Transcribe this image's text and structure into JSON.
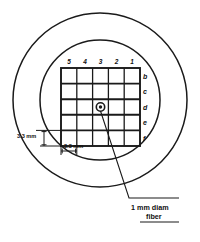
{
  "figure": {
    "background_color": "#ffffff",
    "ink_color": "#1a1a1a"
  },
  "grid": {
    "columns": 5,
    "rows": 5,
    "column_labels": [
      "5",
      "4",
      "3",
      "2",
      "1"
    ],
    "row_labels": [
      "b",
      "c",
      "d",
      "e",
      "f"
    ]
  },
  "marker": {
    "name": "fiber-position-marker",
    "cell_column": "3",
    "cell_row": "d"
  },
  "dimensions": {
    "vertical": {
      "value": "3.3 mm",
      "name": "vertical-dimension"
    },
    "horizontal": {
      "value": "3.3 mm",
      "name": "horizontal-dimension"
    }
  },
  "callout": {
    "line1": "1 mm diam",
    "line2": "fiber"
  },
  "colors": {
    "ink": "#1a1a1a",
    "background": "#ffffff"
  }
}
